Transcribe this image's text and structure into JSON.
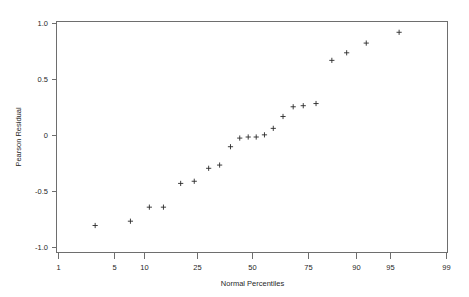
{
  "chart_data": {
    "type": "scatter",
    "title": "",
    "subtitle": "",
    "xlabel": "Normal Percentiles",
    "ylabel": "Pearson Residual",
    "x_scale": "normal-probability",
    "grid": false,
    "legend": null,
    "legend_position": "none",
    "xlim": [
      1,
      99
    ],
    "ylim": [
      -1.07,
      1.07
    ],
    "x_ticks": [
      1,
      5,
      10,
      25,
      50,
      75,
      90,
      95,
      99
    ],
    "x_tick_labels": [
      "1",
      "5",
      "10",
      "25",
      "50",
      "75",
      "90",
      "95",
      "99"
    ],
    "y_ticks": [
      1.0,
      0.5,
      0,
      -0.5,
      -1.0
    ],
    "y_tick_labels": [
      "1.0",
      "0.5",
      "0",
      "-0.5",
      "-1.0"
    ],
    "marker": "plus",
    "marker_color": "#2a2a2a",
    "series": [
      {
        "name": "Pearson Residual",
        "x": [
          3.1,
          7.4,
          11.1,
          14.6,
          19.8,
          24.6,
          30.3,
          35.0,
          39.9,
          44.2,
          48.2,
          52.0,
          55.9,
          60.0,
          64.4,
          68.8,
          72.9,
          77.7,
          82.9,
          87.0,
          91.3,
          96.0
        ],
        "y": [
          -0.82,
          -0.78,
          -0.65,
          -0.65,
          -0.43,
          -0.41,
          -0.29,
          -0.26,
          -0.09,
          -0.01,
          0.0,
          0.0,
          0.02,
          0.08,
          0.19,
          0.28,
          0.29,
          0.31,
          0.71,
          0.78,
          0.87,
          0.97
        ]
      }
    ]
  },
  "axes": {
    "y_axis_label": "Pearson Residual",
    "x_axis_label": "Normal Percentiles"
  },
  "colors": {
    "frame": "#6e6e6e",
    "marker": "#2a2a2a",
    "text": "#1f1f1f",
    "background": "#ffffff"
  }
}
